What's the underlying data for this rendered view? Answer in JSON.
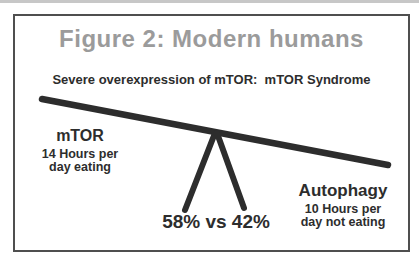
{
  "figure": {
    "title": "Figure 2: Modern humans",
    "subtitle": "Severe overexpression of mTOR:  mTOR Syndrome",
    "left_side": {
      "heading": "mTOR",
      "line1": "14 Hours per",
      "line2": "day eating"
    },
    "right_side": {
      "heading": "Autophagy",
      "line1": "10 Hours per",
      "line2": "day not eating"
    },
    "fulcrum_label": "58% vs 42%"
  },
  "colors": {
    "title": "#9b9b9b",
    "ink": "#2d2d2d",
    "frame_border": "#4f4f4f",
    "background": "#ffffff"
  }
}
